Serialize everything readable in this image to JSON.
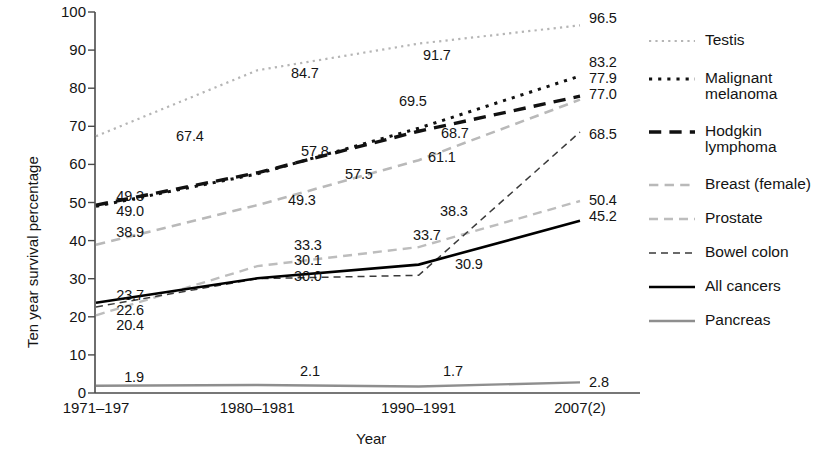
{
  "chart_data": {
    "type": "line",
    "title": "",
    "xlabel": "Year",
    "ylabel": "Ten year survival percentage",
    "categories": [
      "1971–197",
      "1980–1981",
      "1990–1991",
      "2007(2)"
    ],
    "ylim": [
      0,
      100
    ],
    "yticks": [
      "0",
      "10",
      "20",
      "30",
      "40",
      "50",
      "60",
      "70",
      "80",
      "90",
      "100"
    ],
    "grid": false,
    "legend_position": "right",
    "series": [
      {
        "name": "Testis",
        "values": [
          67.4,
          84.7,
          91.7,
          96.5
        ],
        "color": "#b5b5b5",
        "style": "dotted",
        "width": 2.2
      },
      {
        "name": "Malignant\nmelanoma",
        "values": [
          49.0,
          57.5,
          69.5,
          83.2
        ],
        "color": "#111111",
        "style": "dotted",
        "width": 3.0
      },
      {
        "name": "Hodgkin\nlymphoma",
        "values": [
          49.3,
          57.8,
          68.7,
          77.9
        ],
        "color": "#111111",
        "style": "dashed-long",
        "width": 3.4
      },
      {
        "name": "Breast (female)",
        "values": [
          38.9,
          49.3,
          61.1,
          77.0
        ],
        "color": "#b9b9b9",
        "style": "dashed-long",
        "width": 2.6
      },
      {
        "name": "Prostate",
        "values": [
          20.4,
          33.3,
          38.3,
          50.4
        ],
        "color": "#bdbdbd",
        "style": "dashed-med",
        "width": 2.4
      },
      {
        "name": "Bowel colon",
        "values": [
          22.6,
          30.0,
          30.9,
          68.5
        ],
        "color": "#3a3a3a",
        "style": "dashed-thin",
        "width": 1.5
      },
      {
        "name": "All cancers",
        "values": [
          23.7,
          30.1,
          33.7,
          45.2
        ],
        "color": "#000000",
        "style": "solid",
        "width": 2.6
      },
      {
        "name": "Pancreas",
        "values": [
          1.9,
          2.1,
          1.7,
          2.8
        ],
        "color": "#8e8e8e",
        "style": "solid",
        "width": 2.4
      }
    ],
    "point_labels": [
      {
        "text": "67.4",
        "x": 176,
        "y": 128,
        "align": "left"
      },
      {
        "text": "84.7",
        "x": 291,
        "y": 65,
        "align": "left"
      },
      {
        "text": "91.7",
        "x": 423,
        "y": 47,
        "align": "left"
      },
      {
        "text": "96.5",
        "x": 589,
        "y": 10,
        "align": "left"
      },
      {
        "text": "49.0",
        "x": 144,
        "y": 203,
        "align": "right"
      },
      {
        "text": "57.5",
        "x": 345,
        "y": 166,
        "align": "left"
      },
      {
        "text": "69.5",
        "x": 399,
        "y": 93,
        "align": "left"
      },
      {
        "text": "83.2",
        "x": 589,
        "y": 54,
        "align": "left"
      },
      {
        "text": "49.3",
        "x": 144,
        "y": 188,
        "align": "right"
      },
      {
        "text": "57.8",
        "x": 301,
        "y": 143,
        "align": "left"
      },
      {
        "text": "68.7",
        "x": 441,
        "y": 125,
        "align": "left"
      },
      {
        "text": "77.9",
        "x": 589,
        "y": 70,
        "align": "left"
      },
      {
        "text": "38.9",
        "x": 144,
        "y": 224,
        "align": "right"
      },
      {
        "text": "49.3",
        "x": 288,
        "y": 192,
        "align": "left"
      },
      {
        "text": "61.1",
        "x": 428,
        "y": 149,
        "align": "left"
      },
      {
        "text": "77.0",
        "x": 589,
        "y": 86,
        "align": "left"
      },
      {
        "text": "20.4",
        "x": 144,
        "y": 317,
        "align": "right"
      },
      {
        "text": "33.3",
        "x": 294,
        "y": 237,
        "align": "left"
      },
      {
        "text": "38.3",
        "x": 440,
        "y": 203,
        "align": "left"
      },
      {
        "text": "50.4",
        "x": 589,
        "y": 192,
        "align": "left"
      },
      {
        "text": "22.6",
        "x": 144,
        "y": 302,
        "align": "right"
      },
      {
        "text": "30.0",
        "x": 294,
        "y": 268,
        "align": "left"
      },
      {
        "text": "30.9",
        "x": 455,
        "y": 256,
        "align": "left"
      },
      {
        "text": "68.5",
        "x": 589,
        "y": 126,
        "align": "left"
      },
      {
        "text": "23.7",
        "x": 144,
        "y": 287,
        "align": "right"
      },
      {
        "text": "30.1",
        "x": 294,
        "y": 252,
        "align": "left"
      },
      {
        "text": "33.7",
        "x": 413,
        "y": 227,
        "align": "left"
      },
      {
        "text": "45.2",
        "x": 589,
        "y": 208,
        "align": "left"
      },
      {
        "text": "1.9",
        "x": 144,
        "y": 369,
        "align": "right"
      },
      {
        "text": "2.1",
        "x": 300,
        "y": 363,
        "align": "left"
      },
      {
        "text": "1.7",
        "x": 443,
        "y": 363,
        "align": "left"
      },
      {
        "text": "2.8",
        "x": 589,
        "y": 374,
        "align": "left"
      }
    ]
  },
  "axes": {
    "y_title": "Ten year survival percentage",
    "x_title": "Year"
  }
}
